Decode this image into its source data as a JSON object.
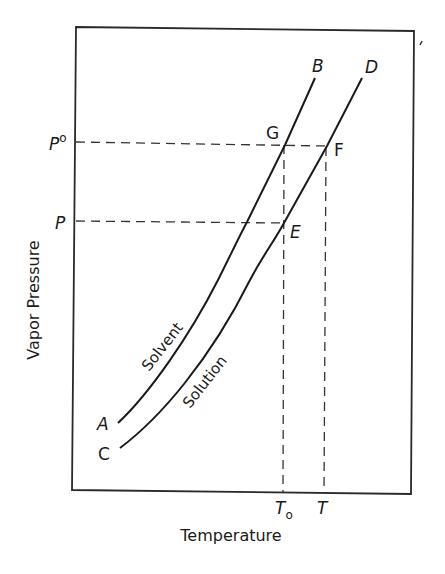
{
  "diagram": {
    "type": "vapor-pressure-temperature",
    "axes": {
      "x_label": "Temperature",
      "y_label": "Vapor Pressure"
    },
    "y_ticks": {
      "p0": "P°",
      "p0_main": "P",
      "p0_sup": "o",
      "p": "P"
    },
    "x_ticks": {
      "t0_main": "T",
      "t0_sub": "o",
      "t": "T"
    },
    "curves": [
      {
        "name": "Solvent",
        "start_label": "A",
        "end_label": "B"
      },
      {
        "name": "Solution",
        "start_label": "C",
        "end_label": "D"
      }
    ],
    "points": {
      "g": "G",
      "f": "F",
      "e": "E"
    },
    "colors": {
      "line": "#1a1a1a",
      "background": "#ffffff"
    }
  }
}
